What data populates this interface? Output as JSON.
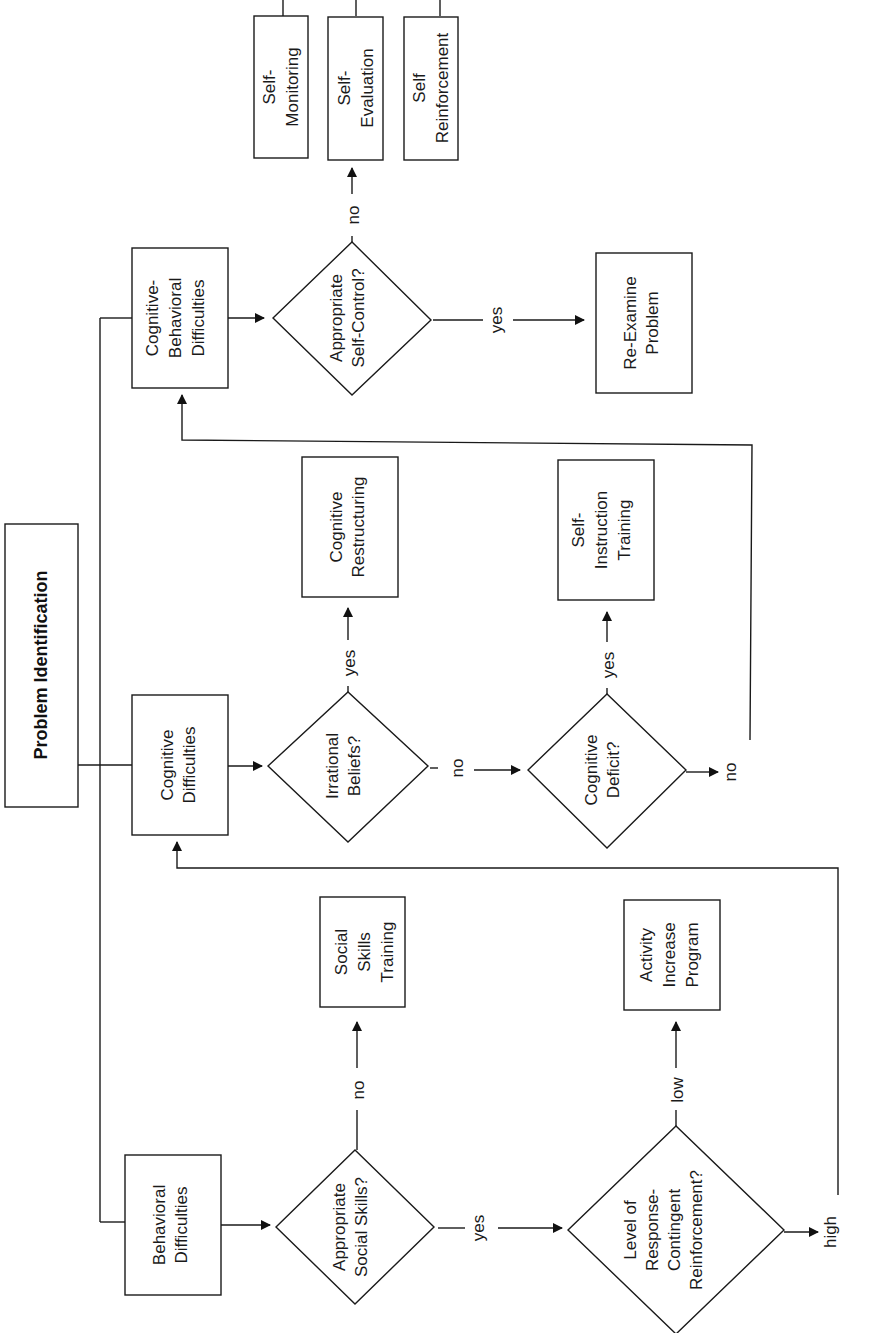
{
  "diagram": {
    "orientation": "rotated-90-ccw",
    "title": "Problem Identification",
    "nodes": {
      "behavioral": {
        "lines": [
          "Behavioral",
          "Difficulties"
        ],
        "type": "box"
      },
      "cognitive": {
        "lines": [
          "Cognitive",
          "Difficulties"
        ],
        "type": "box"
      },
      "cognitive_behavioral": {
        "lines": [
          "Cognitive-",
          "Behavioral",
          "Difficulties"
        ],
        "type": "box"
      },
      "q_social_skills": {
        "lines": [
          "Appropriate",
          "Social Skills?"
        ],
        "type": "decision"
      },
      "q_reinforcement": {
        "lines": [
          "Level of",
          "Response-",
          "Contingent",
          "Reinforcement?"
        ],
        "type": "decision"
      },
      "q_irrational": {
        "lines": [
          "Irrational",
          "Beliefs?"
        ],
        "type": "decision"
      },
      "q_cog_deficit": {
        "lines": [
          "Cognitive",
          "Deficit?"
        ],
        "type": "decision"
      },
      "q_self_control": {
        "lines": [
          "Appropriate",
          "Self-Control?"
        ],
        "type": "decision"
      },
      "social_skills_training": {
        "lines": [
          "Social",
          "Skills",
          "Training"
        ],
        "type": "box"
      },
      "activity_increase": {
        "lines": [
          "Activity",
          "Increase",
          "Program"
        ],
        "type": "box"
      },
      "cognitive_restructuring": {
        "lines": [
          "Cognitive",
          "Restructuring"
        ],
        "type": "box"
      },
      "self_instruction": {
        "lines": [
          "Self-",
          "Instruction",
          "Training"
        ],
        "type": "box"
      },
      "re_examine": {
        "lines": [
          "Re-Examine",
          "Problem"
        ],
        "type": "box"
      },
      "self_monitoring": {
        "lines": [
          "Self-",
          "Monitoring"
        ],
        "type": "box"
      },
      "self_evaluation": {
        "lines": [
          "Self-",
          "Evaluation"
        ],
        "type": "box"
      },
      "self_reinforcement": {
        "lines": [
          "Self",
          "Reinforcement"
        ],
        "type": "box"
      }
    },
    "edge_labels": {
      "social_no": "no",
      "social_yes": "yes",
      "reinf_low": "low",
      "reinf_high": "high",
      "irrational_yes": "yes",
      "irrational_no": "no",
      "deficit_yes": "yes",
      "deficit_no": "no",
      "selfcontrol_no": "no",
      "selfcontrol_yes": "yes"
    },
    "edges": [
      [
        "title",
        "behavioral"
      ],
      [
        "title",
        "cognitive"
      ],
      [
        "title",
        "cognitive_behavioral"
      ],
      [
        "behavioral",
        "q_social_skills"
      ],
      [
        "q_social_skills",
        "social_skills_training",
        "no"
      ],
      [
        "q_social_skills",
        "q_reinforcement",
        "yes"
      ],
      [
        "q_reinforcement",
        "activity_increase",
        "low"
      ],
      [
        "q_reinforcement",
        "cognitive",
        "high"
      ],
      [
        "cognitive",
        "q_irrational"
      ],
      [
        "q_irrational",
        "cognitive_restructuring",
        "yes"
      ],
      [
        "q_irrational",
        "q_cog_deficit",
        "no"
      ],
      [
        "q_cog_deficit",
        "self_instruction",
        "yes"
      ],
      [
        "q_cog_deficit",
        "cognitive_behavioral",
        "no"
      ],
      [
        "cognitive_behavioral",
        "q_self_control"
      ],
      [
        "q_self_control",
        "self_evaluation",
        "no"
      ],
      [
        "q_self_control",
        "re_examine",
        "yes"
      ],
      [
        "self_evaluation",
        "self_monitoring"
      ],
      [
        "self_evaluation",
        "self_reinforcement"
      ]
    ]
  }
}
